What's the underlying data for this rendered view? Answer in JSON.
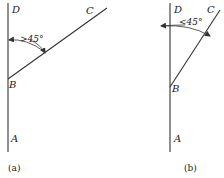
{
  "figures": [
    {
      "id": "a",
      "caption": "(a)",
      "points": {
        "A": "A",
        "B": "B",
        "C": "C",
        "D": "D"
      },
      "angle_label": ">45°"
    },
    {
      "id": "b",
      "caption": "(b)",
      "points": {
        "A": "A",
        "B": "B",
        "C": "C",
        "D": "D"
      },
      "angle_label": "<45°"
    }
  ],
  "colors": {
    "line": "#333333",
    "text": "#222222",
    "background": "#ffffff"
  }
}
